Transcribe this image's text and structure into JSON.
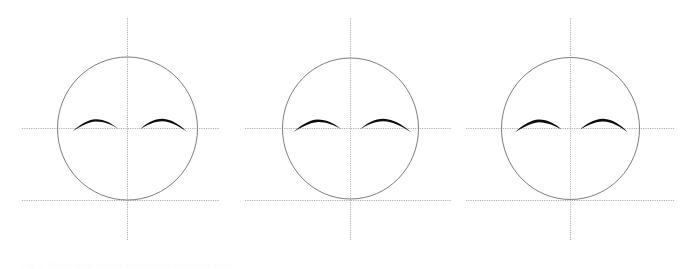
{
  "figure": {
    "title": "",
    "background_color": "#ffffff",
    "width": 692,
    "height": 269,
    "caption_remnant": "Fig. 1. Three facial feature models with reference axes",
    "colors": {
      "outline": "#6e6e74",
      "axis": "#9a9aa2",
      "feature": "#0d0d0f",
      "background": "#ffffff"
    },
    "stroke_widths": {
      "outline": 0.9,
      "axis": 0.8,
      "feature": 2.2
    },
    "line_styles": {
      "vertical_axis": "dotted",
      "horizontal_axis": "dotted",
      "baseline": "dotted",
      "head_outline": "solid",
      "brow": "solid"
    }
  },
  "chart_data": {
    "type": "diagram",
    "xlabel": "",
    "ylabel": "",
    "panel_count": 3,
    "panels": [
      {
        "index": 1,
        "label": "panel-1",
        "head": {
          "shape": "ellipse",
          "cx": 127.5,
          "cy": 128.5,
          "rx": 70.0,
          "ry": 71.5
        },
        "vertical_axis": {
          "x": 127.5,
          "y1": 18,
          "y2": 240
        },
        "horizontal_axis": {
          "y": 128.5,
          "x1": 22,
          "x2": 219
        },
        "baseline": {
          "y": 200.5,
          "x1": 22,
          "x2": 219
        },
        "brows": [
          {
            "side": "left",
            "start": [
              72,
              131
            ],
            "peak": [
              95,
              120
            ],
            "end": [
              118,
              129
            ],
            "max_thickness": 2.6
          },
          {
            "side": "right",
            "start": [
              140,
              129
            ],
            "peak": [
              163,
              119
            ],
            "end": [
              186,
              131
            ],
            "max_thickness": 2.6
          }
        ]
      },
      {
        "index": 2,
        "label": "panel-2",
        "head": {
          "shape": "circle",
          "cx": 350.5,
          "cy": 128.5,
          "rx": 68.0,
          "ry": 70.5
        },
        "vertical_axis": {
          "x": 350.5,
          "y1": 18,
          "y2": 240
        },
        "horizontal_axis": {
          "y": 128.5,
          "x1": 245,
          "x2": 452
        },
        "baseline": {
          "y": 200.5,
          "x1": 245,
          "x2": 452
        },
        "brows": [
          {
            "side": "left",
            "start": [
              293,
              132
            ],
            "peak": [
              317,
              120
            ],
            "end": [
              341,
              129
            ],
            "max_thickness": 2.6
          },
          {
            "side": "right",
            "start": [
              360,
              129
            ],
            "peak": [
              384,
              119
            ],
            "end": [
              410,
              132
            ],
            "max_thickness": 2.6
          }
        ]
      },
      {
        "index": 3,
        "label": "panel-3",
        "head": {
          "shape": "circle",
          "cx": 570.5,
          "cy": 128.5,
          "rx": 69.0,
          "ry": 71.0
        },
        "vertical_axis": {
          "x": 570.5,
          "y1": 18,
          "y2": 240
        },
        "horizontal_axis": {
          "y": 128.5,
          "x1": 466,
          "x2": 674
        },
        "baseline": {
          "y": 200.5,
          "x1": 466,
          "x2": 674
        },
        "brows": [
          {
            "side": "left",
            "start": [
              515,
              132
            ],
            "peak": [
              538,
              120
            ],
            "end": [
              561,
              130
            ],
            "max_thickness": 2.6
          },
          {
            "side": "right",
            "start": [
              580,
              130
            ],
            "peak": [
              603,
              119
            ],
            "end": [
              627,
              132
            ],
            "max_thickness": 2.6
          }
        ]
      }
    ]
  }
}
